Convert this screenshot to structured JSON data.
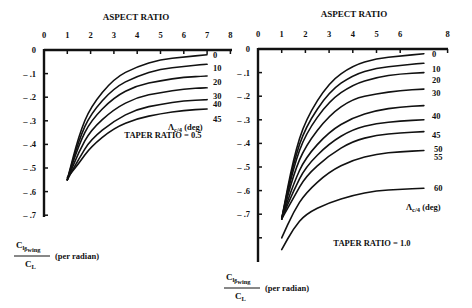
{
  "chart_data": [
    {
      "type": "line",
      "title": "TAPER RATIO = 0.5",
      "xlabel": "ASPECT RATIO",
      "ylabel": "C_l_beta_wing / C_L (per radian)",
      "ylabel_num": "Clβwing",
      "ylabel_den": "CL",
      "ylabel_unit": "(per radian)",
      "legend_title": "Λc/4 (deg)",
      "xticks": [
        "0",
        "1",
        "2",
        "3",
        "4",
        "5",
        "6",
        "7",
        "8"
      ],
      "yticks": [
        "0",
        "-.1",
        "-.2",
        "-.3",
        "-.4",
        "-.5",
        "-.6",
        "-.7"
      ],
      "xlim": [
        0,
        8
      ],
      "ylim": [
        -0.7,
        0
      ],
      "grid": false,
      "x": [
        1.0,
        1.5,
        2.0,
        3.0,
        4.0,
        5.0,
        6.0,
        7.0
      ],
      "series": [
        {
          "name": "0",
          "values": [
            -0.55,
            -0.36,
            -0.24,
            -0.12,
            -0.07,
            -0.04,
            -0.03,
            -0.02
          ]
        },
        {
          "name": "10",
          "values": [
            -0.55,
            -0.38,
            -0.27,
            -0.16,
            -0.11,
            -0.08,
            -0.07,
            -0.06
          ]
        },
        {
          "name": "20",
          "values": [
            -0.55,
            -0.4,
            -0.3,
            -0.2,
            -0.15,
            -0.13,
            -0.115,
            -0.11
          ]
        },
        {
          "name": "30",
          "values": [
            -0.55,
            -0.43,
            -0.34,
            -0.25,
            -0.2,
            -0.18,
            -0.165,
            -0.16
          ]
        },
        {
          "name": "40",
          "values": [
            -0.55,
            -0.46,
            -0.38,
            -0.3,
            -0.25,
            -0.23,
            -0.215,
            -0.21
          ]
        },
        {
          "name": "45",
          "values": [
            -0.54,
            -0.48,
            -0.41,
            -0.33,
            -0.29,
            -0.27,
            -0.255,
            -0.25
          ]
        }
      ]
    },
    {
      "type": "line",
      "title": "TAPER RATIO = 1.0",
      "xlabel": "ASPECT RATIO",
      "ylabel": "C_l_beta_wing / C_L (per radian)",
      "ylabel_num": "Clβwing",
      "ylabel_den": "CL",
      "ylabel_unit": "(per radian)",
      "legend_title": "Λc/4 (deg)",
      "xticks": [
        "0",
        "1",
        "2",
        "3",
        "4",
        "5",
        "6",
        "8"
      ],
      "yticks": [
        "0",
        "-.1",
        "-.2",
        "-.3",
        "-.4",
        "-.5",
        "-.6",
        "-.7"
      ],
      "xlim": [
        0,
        8
      ],
      "ylim": [
        -0.9,
        0
      ],
      "grid": false,
      "x": [
        1.0,
        1.5,
        2.0,
        3.0,
        4.0,
        5.0,
        6.0,
        7.0
      ],
      "series": [
        {
          "name": "0",
          "values": [
            -0.72,
            -0.46,
            -0.3,
            -0.14,
            -0.07,
            -0.04,
            -0.03,
            -0.02
          ]
        },
        {
          "name": "10",
          "values": [
            -0.72,
            -0.48,
            -0.33,
            -0.18,
            -0.11,
            -0.08,
            -0.07,
            -0.06
          ]
        },
        {
          "name": "20",
          "values": [
            -0.72,
            -0.5,
            -0.36,
            -0.22,
            -0.15,
            -0.12,
            -0.105,
            -0.1
          ]
        },
        {
          "name": "30",
          "values": [
            -0.72,
            -0.53,
            -0.41,
            -0.28,
            -0.21,
            -0.19,
            -0.175,
            -0.17
          ]
        },
        {
          "name": "40",
          "values": [
            -0.72,
            -0.57,
            -0.46,
            -0.35,
            -0.29,
            -0.26,
            -0.245,
            -0.24
          ]
        },
        {
          "name": "45",
          "values": [
            -0.72,
            -0.6,
            -0.5,
            -0.4,
            -0.34,
            -0.315,
            -0.305,
            -0.3
          ]
        },
        {
          "name": "50",
          "values": [
            -0.72,
            -0.63,
            -0.54,
            -0.45,
            -0.39,
            -0.365,
            -0.355,
            -0.35
          ]
        },
        {
          "name": "55",
          "values": [
            -0.8,
            -0.69,
            -0.61,
            -0.52,
            -0.47,
            -0.445,
            -0.435,
            -0.43
          ]
        },
        {
          "name": "60",
          "values": [
            -0.85,
            -0.76,
            -0.7,
            -0.65,
            -0.62,
            -0.6,
            -0.595,
            -0.59
          ]
        }
      ]
    }
  ]
}
